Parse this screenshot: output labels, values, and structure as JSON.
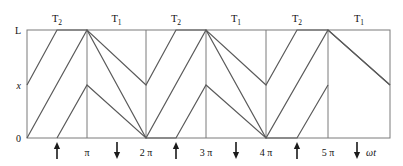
{
  "figure": {
    "kind": "sawtooth-waveform-diagram",
    "y_axis": {
      "labels": [
        {
          "text": "L",
          "value_name": "L",
          "y_px": 30
        },
        {
          "text": "x",
          "value_name": "x",
          "y_px": 85,
          "italic": true
        },
        {
          "text": "0",
          "value_name": "0",
          "y_px": 138
        }
      ]
    },
    "x_axis": {
      "axis_label": "ωt",
      "tick_labels": [
        "π",
        "2 π",
        "3 π",
        "4 π",
        "5 π"
      ],
      "tick_positions_px": [
        87,
        146,
        206,
        266,
        328
      ]
    },
    "top_labels": [
      {
        "base": "T",
        "sub": "2"
      },
      {
        "base": "T",
        "sub": "1"
      },
      {
        "base": "T",
        "sub": "2"
      },
      {
        "base": "T",
        "sub": "1"
      },
      {
        "base": "T",
        "sub": "2"
      },
      {
        "base": "T",
        "sub": "1"
      }
    ],
    "arrows": [
      {
        "direction": "up",
        "x_px": 57
      },
      {
        "direction": "down",
        "x_px": 117
      },
      {
        "direction": "up",
        "x_px": 176
      },
      {
        "direction": "down",
        "x_px": 236
      },
      {
        "direction": "up",
        "x_px": 297
      },
      {
        "direction": "down",
        "x_px": 357
      }
    ],
    "colors": {
      "line": "#5a5a5a",
      "frame": "#7a7a7a",
      "text": "#111111",
      "background": "#ffffff"
    }
  },
  "chart_data": {
    "type": "line",
    "title": "",
    "xlabel": "ωt",
    "ylabel": "x",
    "xlim": [
      0,
      18.8495559215
    ],
    "ylim": [
      0,
      1
    ],
    "grid": true,
    "legend": "none",
    "axis_tick_text_x": [
      "π",
      "2 π",
      "3 π",
      "4 π",
      "5 π"
    ],
    "axis_tick_values_x": [
      3.14159,
      6.28319,
      9.42478,
      12.56637,
      15.70796
    ],
    "axis_tick_text_y": [
      "0",
      "x",
      "L"
    ],
    "axis_tick_values_y": [
      0,
      0.5,
      1
    ],
    "annotations_top": [
      "T2",
      "T1",
      "T2",
      "T1",
      "T2",
      "T1"
    ],
    "annotations_arrows": [
      "up",
      "down",
      "up",
      "down",
      "up",
      "down"
    ],
    "series": [
      {
        "name": "upper-sawtooth",
        "comment": "starts at x level, rises to L, then alternating falls and rises",
        "points_px": [
          [
            27,
            85
          ],
          [
            57,
            30
          ],
          [
            87,
            30
          ],
          [
            146,
            85
          ],
          [
            176,
            30
          ],
          [
            206,
            30
          ],
          [
            266,
            85
          ],
          [
            297,
            30
          ],
          [
            328,
            30
          ],
          [
            390,
            85
          ]
        ],
        "points_data": [
          [
            0.0,
            0.5
          ],
          [
            1.57,
            1.0
          ],
          [
            3.14,
            1.0
          ],
          [
            6.28,
            0.5
          ],
          [
            7.85,
            1.0
          ],
          [
            9.42,
            1.0
          ],
          [
            12.57,
            0.5
          ],
          [
            14.14,
            1.0
          ],
          [
            15.71,
            1.0
          ],
          [
            18.85,
            0.5
          ]
        ]
      },
      {
        "name": "lower-sawtooth",
        "comment": "starts at 0, rises to L at pi, falls to 0 at 2pi, repeating",
        "points_px": [
          [
            27,
            138
          ],
          [
            87,
            30
          ],
          [
            146,
            138
          ],
          [
            206,
            30
          ],
          [
            266,
            138
          ],
          [
            328,
            30
          ],
          [
            390,
            85
          ]
        ],
        "points_data": [
          [
            0.0,
            0.0
          ],
          [
            3.14,
            1.0
          ],
          [
            6.28,
            0.0
          ],
          [
            9.42,
            1.0
          ],
          [
            12.57,
            0.0
          ],
          [
            15.71,
            1.0
          ],
          [
            18.85,
            0.5
          ]
        ]
      },
      {
        "name": "secondary-lower-trace",
        "comment": "lower-amplitude trace: rises from 0 to x level, falls back to 0",
        "points_px": [
          [
            57,
            138
          ],
          [
            87,
            85
          ],
          [
            146,
            138
          ],
          [
            176,
            138
          ],
          [
            206,
            85
          ],
          [
            266,
            138
          ],
          [
            297,
            138
          ],
          [
            328,
            85
          ]
        ],
        "points_data": [
          [
            1.57,
            0.0
          ],
          [
            3.14,
            0.5
          ],
          [
            6.28,
            0.0
          ],
          [
            7.85,
            0.0
          ],
          [
            9.42,
            0.5
          ],
          [
            12.57,
            0.0
          ],
          [
            14.14,
            0.0
          ],
          [
            15.71,
            0.5
          ]
        ]
      }
    ]
  }
}
